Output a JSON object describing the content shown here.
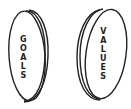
{
  "coins": [
    {
      "label": "GOALS",
      "letters": [
        "G",
        "O",
        "A",
        "L",
        "S"
      ]
    },
    {
      "label": "VALUES",
      "letters": [
        "V",
        "A",
        "L",
        "U",
        "E",
        "S"
      ]
    }
  ],
  "colors": {
    "stroke": "#222222",
    "background": "#ffffff"
  }
}
